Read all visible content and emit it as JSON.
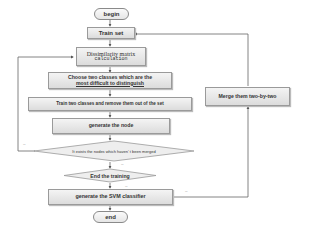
{
  "flowchart": {
    "begin": "begin",
    "train_set": "Train set",
    "dissimilarity_line1": "Dissimilarity matrix",
    "dissimilarity_line2": "calculation",
    "choose_line1": "Choose two classes which are the",
    "choose_line2": "most difficult to distinguish",
    "train_two": "Train two classes and remove them out of the set",
    "generate_node": "generate the node",
    "decision_merged": "It exists the nodes which haven' t been merged",
    "decision_end": "End the training",
    "generate_svm": "generate the SVM classifier",
    "end": "end",
    "merge": "Merge them two-by-two",
    "edge_labels": {
      "loop_left": "--",
      "decision_down": "--",
      "end_down": "--",
      "svm_right": "--"
    }
  }
}
